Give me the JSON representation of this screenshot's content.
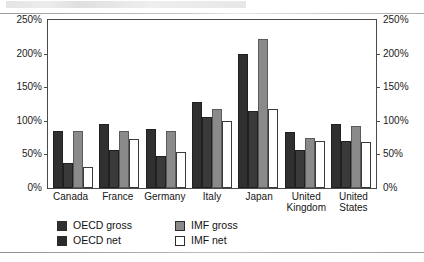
{
  "chart_data": {
    "type": "bar",
    "title": "",
    "xlabel": "",
    "ylabel": "",
    "ylim": [
      0,
      250
    ],
    "ytick_labels": [
      "0%",
      "50%",
      "100%",
      "150%",
      "200%",
      "250%"
    ],
    "ytick_values": [
      0,
      50,
      100,
      150,
      200,
      250
    ],
    "grid": false,
    "legend_position": "below-axes",
    "dual_axis": true,
    "axis_units": "percent",
    "categories": [
      "Canada",
      "France",
      "Germany",
      "Italy",
      "Japan",
      "United Kingdom",
      "United States"
    ],
    "category_lines": [
      [
        "Canada"
      ],
      [
        "France"
      ],
      [
        "Germany"
      ],
      [
        "Italy"
      ],
      [
        "Japan"
      ],
      [
        "United",
        "Kingdom"
      ],
      [
        "United",
        "States"
      ]
    ],
    "series": [
      {
        "name": "OECD gross",
        "color": "#303030",
        "values": [
          85,
          95,
          88,
          128,
          200,
          84,
          95
        ]
      },
      {
        "name": "OECD net",
        "color": "#3a3a3a",
        "values": [
          37,
          57,
          48,
          105,
          115,
          57,
          70
        ]
      },
      {
        "name": "IMF gross",
        "color": "#8a8a8a",
        "values": [
          85,
          85,
          85,
          118,
          222,
          75,
          93
        ]
      },
      {
        "name": "IMF net",
        "color": "#ffffff",
        "values": [
          32,
          73,
          53,
          100,
          118,
          70,
          68
        ]
      }
    ]
  },
  "legend": {
    "entries": [
      {
        "label": "OECD gross",
        "swatch": "oecd-gross"
      },
      {
        "label": "IMF gross",
        "swatch": "imf-gross"
      },
      {
        "label": "OECD net",
        "swatch": "oecd-net"
      },
      {
        "label": "IMF net",
        "swatch": "imf-net"
      }
    ]
  }
}
